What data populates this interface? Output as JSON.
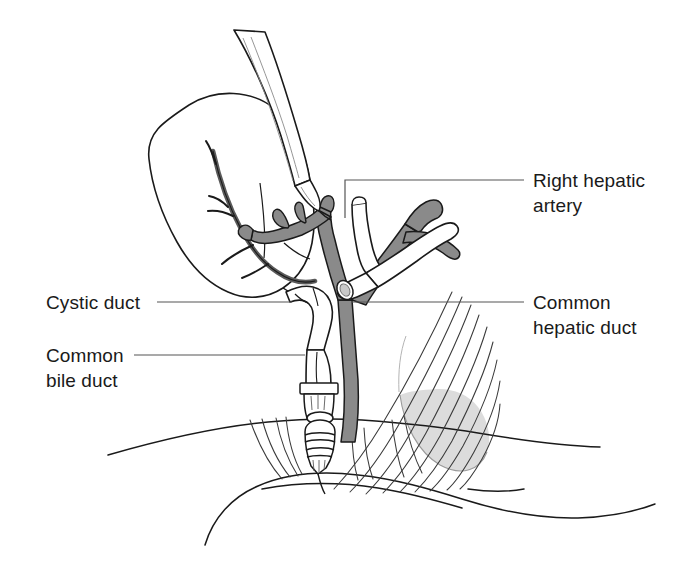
{
  "figure": {
    "kind": "medical-line-illustration",
    "background_color": "#ffffff",
    "ink_color": "#1a1a1a",
    "artery_fill_color": "#8a8a8a",
    "duct_fill_color": "#ffffff",
    "soft_tissue_shade_color": "#d9d9d9",
    "width": 681,
    "height": 572
  },
  "labels": [
    {
      "id": "right-hepatic-artery",
      "text": "Right hepatic\nartery",
      "line1": "Right hepatic",
      "line2": "artery",
      "side": "right",
      "leader": "elbow-down-left"
    },
    {
      "id": "common-hepatic-duct",
      "text": "Common\nhepatic duct",
      "line1": "Common",
      "line2": "hepatic duct",
      "side": "right",
      "leader": "horizontal-left"
    },
    {
      "id": "cystic-duct",
      "text": "Cystic duct",
      "line1": "Cystic duct",
      "line2": "",
      "side": "left",
      "leader": "horizontal-right"
    },
    {
      "id": "common-bile-duct",
      "text": "Common\nbile duct",
      "line1": "Common",
      "line2": "bile duct",
      "side": "left",
      "leader": "horizontal-right"
    }
  ],
  "structures": [
    {
      "id": "gallbladder",
      "name": "gallbladder"
    },
    {
      "id": "cystic-artery",
      "name": "cystic artery"
    },
    {
      "id": "right-hepatic-artery",
      "name": "right hepatic artery"
    },
    {
      "id": "proper-hepatic-artery",
      "name": "proper hepatic artery"
    },
    {
      "id": "common-hepatic-duct",
      "name": "common hepatic duct"
    },
    {
      "id": "cystic-duct",
      "name": "cystic duct"
    },
    {
      "id": "common-bile-duct",
      "name": "common bile duct"
    },
    {
      "id": "surgical-clips",
      "name": "surgical clips"
    },
    {
      "id": "grasper",
      "name": "laparoscopic grasper instrument"
    },
    {
      "id": "duodenum",
      "name": "duodenum"
    },
    {
      "id": "fibrous-tissue",
      "name": "fibrous connective tissue strands"
    }
  ]
}
